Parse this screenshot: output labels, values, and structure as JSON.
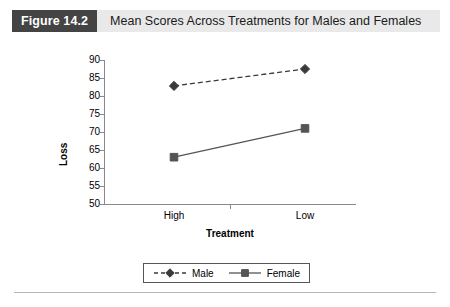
{
  "figure": {
    "number_label": "Figure 14.2",
    "title": "Mean Scores Across Treatments for Males and Females"
  },
  "colors": {
    "figure_number_bg": "#444444",
    "figure_header_bg": "#e9e9e9",
    "axis": "#8a8a8a",
    "male_series": "#3a3a3a",
    "female_series": "#555555",
    "footer_rule": "#b5b5b5"
  },
  "chart_data": {
    "type": "line",
    "title": "Mean Scores Across Treatments for Males and Females",
    "xlabel": "Treatment",
    "ylabel": "Loss",
    "categories": [
      "High",
      "Low"
    ],
    "ylim": [
      50,
      90
    ],
    "yticks": [
      50,
      55,
      60,
      65,
      70,
      75,
      80,
      85,
      90
    ],
    "ytick_labels": [
      "50",
      "55",
      "60",
      "65",
      "70",
      "75",
      "80",
      "85",
      "90"
    ],
    "grid": false,
    "legend_position": "bottom-center",
    "series": [
      {
        "name": "Male",
        "values": [
          82.8,
          87.5
        ],
        "marker": "diamond",
        "linestyle": "dashed",
        "color": "#3a3a3a"
      },
      {
        "name": "Female",
        "values": [
          63.0,
          71.0
        ],
        "marker": "square",
        "linestyle": "solid",
        "color": "#555555"
      }
    ]
  },
  "legend": {
    "entries": [
      {
        "label": "Male",
        "marker": "diamond-marker-icon",
        "linestyle": "dashed"
      },
      {
        "label": "Female",
        "marker": "square-marker-icon",
        "linestyle": "solid"
      }
    ]
  }
}
